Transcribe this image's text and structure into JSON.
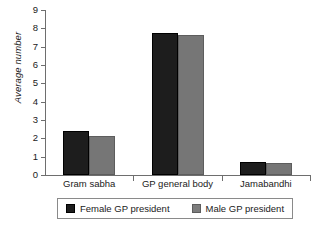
{
  "chart_data": {
    "type": "bar",
    "title": "",
    "xlabel": "",
    "ylabel": "Average number",
    "categories": [
      "Gram sabha",
      "GP general body",
      "Jamabandhi"
    ],
    "series": [
      {
        "name": "Female GP president",
        "color": "#1d1d1d",
        "values": [
          2.4,
          7.75,
          0.7
        ]
      },
      {
        "name": "Male GP president",
        "color": "#767676",
        "values": [
          2.15,
          7.65,
          0.68
        ]
      }
    ],
    "ylim": [
      0,
      9
    ],
    "ytick_labels": [
      "0",
      "1",
      "2",
      "3",
      "4",
      "5",
      "6",
      "7",
      "8",
      "9"
    ],
    "ytick_values": [
      0,
      1,
      2,
      3,
      4,
      5,
      6,
      7,
      8,
      9
    ],
    "grid": false,
    "legend_position": "bottom"
  },
  "legend": {
    "entries": [
      {
        "label": "Female GP president",
        "swatch": "female-swatch"
      },
      {
        "label": "Male GP president",
        "swatch": "male-swatch"
      }
    ]
  }
}
